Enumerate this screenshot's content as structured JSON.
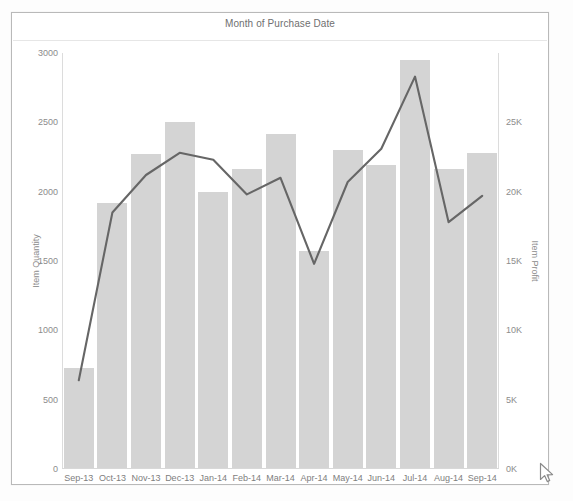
{
  "chart_data": {
    "type": "bar",
    "title": "Month of Purchase Date",
    "xlabel": "",
    "categories": [
      "Sep-13",
      "Oct-13",
      "Nov-13",
      "Dec-13",
      "Jan-14",
      "Feb-14",
      "Mar-14",
      "Apr-14",
      "May-14",
      "Jun-14",
      "Jul-14",
      "Aug-14",
      "Sep-14"
    ],
    "grid": false,
    "legend": "none",
    "series": [
      {
        "name": "Item Quantity",
        "type": "bar",
        "axis": "left",
        "color": "#d4d4d4",
        "values": [
          725,
          1920,
          2275,
          2500,
          2000,
          2160,
          2415,
          1575,
          2300,
          2195,
          2950,
          2160,
          2280
        ]
      },
      {
        "name": "Item Profit",
        "type": "line",
        "axis": "right",
        "color": "#666666",
        "values": [
          6400,
          18500,
          21200,
          22800,
          22300,
          19800,
          21000,
          14800,
          20700,
          23100,
          28300,
          17800,
          19700
        ]
      }
    ],
    "axes": {
      "left": {
        "label": "Item Quantity",
        "ylim": [
          0,
          3000
        ],
        "ticks": [
          0,
          500,
          1000,
          1500,
          2000,
          2500,
          3000
        ],
        "tick_labels": [
          "0",
          "500",
          "1000",
          "1500",
          "2000",
          "2500",
          "3000"
        ]
      },
      "right": {
        "label": "Item Profit",
        "ylim": [
          0,
          30000
        ],
        "ticks": [
          0,
          5000,
          10000,
          15000,
          20000,
          25000
        ],
        "tick_labels": [
          "0K",
          "5K",
          "10K",
          "15K",
          "20K",
          "25K"
        ]
      }
    }
  },
  "cursor": {
    "icon": "mouse-pointer-icon"
  }
}
